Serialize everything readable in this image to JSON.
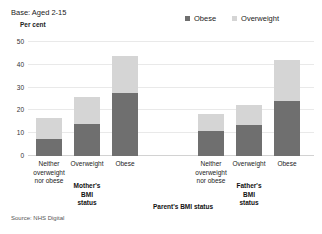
{
  "header": {
    "base_note": "Base: Aged 2-15",
    "axis_unit": "Per cent",
    "source": "Source: NHS Digital"
  },
  "legend": {
    "position": "top-right",
    "items": [
      {
        "label": "Obese",
        "color": "#6f6f6f",
        "swatch_name": "legend-swatch-obese"
      },
      {
        "label": "Overweight",
        "color": "#d5d5d5",
        "swatch_name": "legend-swatch-overweight"
      }
    ]
  },
  "groups": [
    {
      "title": "Mother's\nBMI\nstatus"
    },
    {
      "title": "Father's\nBMI\nstatus"
    }
  ],
  "axis_title": "Parent's BMI status",
  "chart_data": {
    "type": "bar",
    "title": "",
    "subtitle": "Base: Aged 2-15",
    "xlabel": "Parent's BMI status",
    "ylabel": "Per cent",
    "stacked": true,
    "grid": true,
    "legend_position": "top-right",
    "ylim": [
      0,
      50
    ],
    "yticks": [
      0,
      10,
      20,
      30,
      40,
      50
    ],
    "ytick_labels": [
      "0",
      "10",
      "20",
      "30",
      "40",
      "50"
    ],
    "groups": [
      "Mother's BMI status",
      "Father's BMI status"
    ],
    "categories": [
      "Neither\noverweight\nnor obese",
      "Overweight",
      "Obese",
      "Neither\noverweight\nnor obese",
      "Overweight",
      "Obese"
    ],
    "series": [
      {
        "name": "Obese",
        "color": "#6f6f6f",
        "values": [
          7.5,
          14,
          27.5,
          11,
          13.5,
          24
        ]
      },
      {
        "name": "Overweight",
        "color": "#d5d5d5",
        "values": [
          9,
          12,
          16.5,
          7.5,
          9,
          18
        ]
      }
    ],
    "totals": [
      16.5,
      26,
      44,
      18.5,
      22.5,
      42
    ]
  }
}
